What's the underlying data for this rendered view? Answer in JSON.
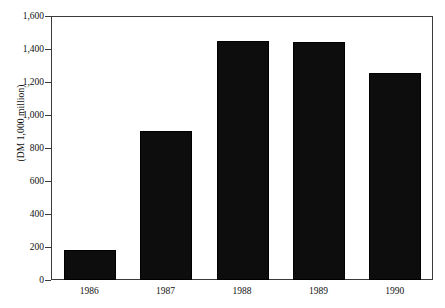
{
  "chart_data": {
    "type": "bar",
    "title": "",
    "subtitle": "",
    "xlabel": "",
    "ylabel": "(DM 1,000 million)",
    "categories": [
      "1986",
      "1987",
      "1988",
      "1989",
      "1990"
    ],
    "values": [
      180,
      905,
      1450,
      1440,
      1255
    ],
    "series": [
      {
        "name": "",
        "values": [
          180,
          905,
          1450,
          1440,
          1255
        ]
      }
    ],
    "ylim": [
      0,
      1600
    ],
    "y_ticks": [
      0,
      200,
      400,
      600,
      800,
      1000,
      1200,
      1400,
      1600
    ],
    "y_tick_labels": [
      "0",
      "200",
      "400",
      "600",
      "800",
      "1,000",
      "1,200",
      "1,400",
      "1,600"
    ],
    "grid": false,
    "legend": null,
    "legend_position": "none",
    "bar_color": "#0d0d0d",
    "axis_color": "#3a3a3a",
    "background_color": "#ffffff",
    "annotations": []
  }
}
